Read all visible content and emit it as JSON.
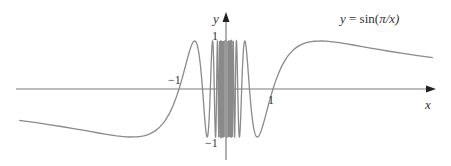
{
  "chart_data": {
    "type": "line",
    "title": "",
    "function": "y = sin(pi/x)",
    "xlabel": "x",
    "ylabel": "y",
    "xlim": [
      -4.4,
      4.4
    ],
    "ylim": [
      -1,
      1
    ],
    "grid": false,
    "legend": null,
    "x_ticks": [
      -1,
      1
    ],
    "y_ticks": [
      1,
      -1
    ],
    "tick_labels": {
      "x_neg1": "−1",
      "x_pos1": "1",
      "y_pos1": "1",
      "y_neg1": "−1"
    },
    "annotation": {
      "text_prefix": "y",
      "text_eq": " = sin(",
      "text_pi": "π",
      "text_suffix": "/x)"
    },
    "series": [
      {
        "name": "sin(π/x)",
        "color": "#8a8a8a",
        "x": [
          -4.4,
          -4.0,
          -3.5,
          -3.0,
          -2.5,
          -2.0,
          -1.75,
          -1.5,
          -1.25,
          -1.0,
          -0.8,
          -0.667,
          -0.5,
          -0.4,
          -0.333,
          -0.286,
          -0.25,
          -0.2,
          0.2,
          0.25,
          0.286,
          0.333,
          0.4,
          0.5,
          0.667,
          0.8,
          1.0,
          1.25,
          1.5,
          1.75,
          2.0,
          2.5,
          3.0,
          3.5,
          4.0,
          4.4
        ],
        "y": [
          -0.66,
          -0.71,
          -0.78,
          -0.87,
          -0.95,
          -1.0,
          -0.97,
          -0.87,
          -0.59,
          0.0,
          0.71,
          1.0,
          0.0,
          -1.0,
          0.0,
          1.0,
          0.0,
          0.0,
          0.0,
          0.0,
          -1.0,
          0.0,
          1.0,
          0.0,
          -1.0,
          -0.71,
          0.0,
          0.59,
          0.87,
          0.97,
          1.0,
          0.95,
          0.87,
          0.78,
          0.71,
          0.66
        ]
      }
    ],
    "colors": {
      "axis": "#7a7a7a",
      "curve": "#8a8a8a",
      "text": "#333333"
    }
  }
}
